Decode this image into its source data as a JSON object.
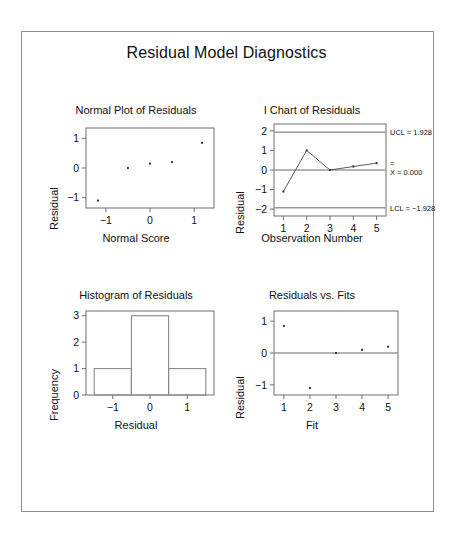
{
  "figure": {
    "title": "Residual Model Diagnostics",
    "frame_color": "#8d8d8d",
    "background": "#ffffff"
  },
  "chart_data": [
    {
      "type": "scatter",
      "panel": "normal-plot",
      "title": "Normal Plot of Residuals",
      "xlabel": "Normal Score",
      "ylabel": "Residual",
      "xlim": [
        -1.45,
        1.45
      ],
      "ylim": [
        -1.35,
        1.35
      ],
      "xticks": [
        -1,
        0,
        1
      ],
      "xticklabels": [
        "−1",
        "0",
        "1"
      ],
      "yticks": [
        -1,
        0,
        1
      ],
      "yticklabels": [
        "−1",
        "0",
        "1"
      ],
      "grid": false,
      "x": [
        -1.18,
        -0.5,
        0.0,
        0.5,
        1.18
      ],
      "y": [
        -1.1,
        0.0,
        0.15,
        0.2,
        0.85
      ]
    },
    {
      "type": "line",
      "panel": "i-chart",
      "title": "I Chart of Residuals",
      "xlabel": "Observation Number",
      "ylabel": "Residual",
      "xlim": [
        0.6,
        5.4
      ],
      "ylim": [
        -2.35,
        2.35
      ],
      "xticks": [
        1,
        2,
        3,
        4,
        5
      ],
      "xticklabels": [
        "1",
        "2",
        "3",
        "4",
        "5"
      ],
      "yticks": [
        -2,
        -1,
        0,
        1,
        2
      ],
      "yticklabels": [
        "−2",
        "−1",
        "0",
        "1",
        "2"
      ],
      "grid": false,
      "x": [
        1,
        2,
        3,
        4,
        5
      ],
      "values": [
        -1.1,
        1.0,
        0.0,
        0.18,
        0.35
      ],
      "control_limits": {
        "ucl": 1.928,
        "center": 0.0,
        "lcl": -1.928,
        "ucl_label": "UCL = 1.928",
        "center_label": "X = 0.000",
        "center_label_overbar": "=",
        "lcl_label": "LCL = −1.928"
      }
    },
    {
      "type": "bar",
      "panel": "histogram",
      "title": "Histogram of Residuals",
      "xlabel": "Residual",
      "ylabel": "Frequency",
      "xlim": [
        -1.72,
        1.72
      ],
      "ylim": [
        0,
        3.18
      ],
      "xticks": [
        -1,
        0,
        1
      ],
      "xticklabels": [
        "−1",
        "0",
        "1"
      ],
      "yticks": [
        0,
        1,
        2,
        3
      ],
      "yticklabels": [
        "0",
        "1",
        "2",
        "3"
      ],
      "grid": false,
      "bins": [
        {
          "left": -1.5,
          "right": -0.5,
          "value": 1
        },
        {
          "left": -0.5,
          "right": 0.5,
          "value": 3
        },
        {
          "left": 0.5,
          "right": 1.5,
          "value": 1
        }
      ]
    },
    {
      "type": "scatter",
      "panel": "residuals-vs-fits",
      "title": "Residuals vs. Fits",
      "xlabel": "Fit",
      "ylabel": "Residual",
      "xlim": [
        0.62,
        5.38
      ],
      "ylim": [
        -1.32,
        1.32
      ],
      "xticks": [
        1,
        2,
        3,
        4,
        5
      ],
      "xticklabels": [
        "1",
        "2",
        "3",
        "4",
        "5"
      ],
      "yticks": [
        -1,
        0,
        1
      ],
      "yticklabels": [
        "−1",
        "0",
        "1"
      ],
      "grid": false,
      "zero_line": 0,
      "x": [
        1,
        2,
        3,
        4,
        5
      ],
      "y": [
        0.85,
        -1.1,
        0.0,
        0.1,
        0.2
      ]
    }
  ]
}
